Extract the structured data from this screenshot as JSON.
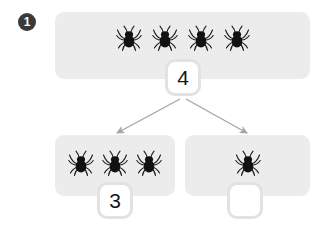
{
  "question": {
    "number": "1",
    "type": "number-bond-part-part-whole"
  },
  "colors": {
    "panel_background": "#ececec",
    "badge_background": "#3a3a3a",
    "badge_text": "#ffffff",
    "answer_box_border": "#e2e2e2",
    "answer_box_fill": "#ffffff",
    "arrow": "#a6a6a6",
    "object_body": "#111111",
    "page_background": "#ffffff"
  },
  "whole": {
    "panel_name": "whole-panel",
    "object_icon": "spider-icon",
    "object_count": 4,
    "objects": [
      "spider-icon",
      "spider-icon",
      "spider-icon",
      "spider-icon"
    ],
    "answer_value": "4",
    "answer_filled": true
  },
  "parts": [
    {
      "panel_name": "part-panel-left",
      "object_icon": "spider-icon",
      "object_count": 3,
      "objects": [
        "spider-icon",
        "spider-icon",
        "spider-icon"
      ],
      "answer_value": "3",
      "answer_filled": true
    },
    {
      "panel_name": "part-panel-right",
      "object_icon": "spider-icon",
      "object_count": 1,
      "objects": [
        "spider-icon"
      ],
      "answer_value": "",
      "answer_filled": false
    }
  ],
  "arrows": [
    {
      "name": "arrow-to-left-part",
      "icon": "arrow-down-left-icon",
      "from": "whole-answer-box",
      "to": "part-panel-left"
    },
    {
      "name": "arrow-to-right-part",
      "icon": "arrow-down-right-icon",
      "from": "whole-answer-box",
      "to": "part-panel-right"
    }
  ]
}
